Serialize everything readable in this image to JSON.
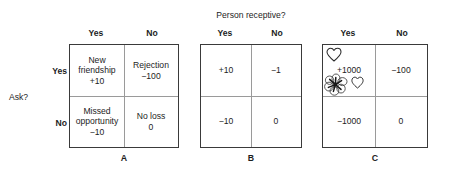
{
  "figure": {
    "column_question": "Person receptive?",
    "row_question": "Ask?",
    "column_headers": [
      "Yes",
      "No"
    ],
    "row_headers": [
      "Yes",
      "No"
    ],
    "panels": [
      {
        "letter": "A",
        "cells": {
          "top_left": [
            "New",
            "friendship",
            "+10"
          ],
          "top_right": [
            "Rejection",
            "−100"
          ],
          "bottom_left": [
            "Missed",
            "opportunity",
            "−10"
          ],
          "bottom_right": [
            "No loss",
            "0"
          ]
        }
      },
      {
        "letter": "B",
        "cells": {
          "top_left": [
            "+10"
          ],
          "top_right": [
            "−1"
          ],
          "bottom_left": [
            "−10"
          ],
          "bottom_right": [
            "0"
          ]
        }
      },
      {
        "letter": "C",
        "cells": {
          "top_left": [
            "+1000"
          ],
          "top_right": [
            "−100"
          ],
          "bottom_left": [
            "−1000"
          ],
          "bottom_right": [
            "0"
          ]
        },
        "decorations": [
          {
            "name": "heart-outline-top",
            "glyph": "heart"
          },
          {
            "name": "flower-doodle",
            "glyph": "flower"
          },
          {
            "name": "heart-outline-small",
            "glyph": "heart"
          }
        ]
      }
    ]
  },
  "colors": {
    "background": "#ffffff",
    "border": "#3a3a3a",
    "gridline": "#9a9a9a",
    "text": "#1d1d1d"
  }
}
